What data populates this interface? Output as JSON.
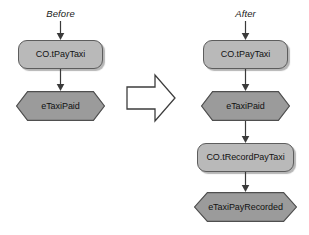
{
  "diagram": {
    "type": "before-after-process-flow",
    "title": "",
    "columns": [
      {
        "id": "before",
        "label": "Before",
        "nodes": [
          {
            "id": "before-task-paytaxi",
            "kind": "task",
            "shape": "rounded-rectangle",
            "label": "CO.tPayTaxi",
            "fill": "#b9b9b9"
          },
          {
            "id": "before-event-taxipaid",
            "kind": "event",
            "shape": "hexagon",
            "label": "eTaxiPaid",
            "fill": "#9b9b9b"
          }
        ]
      },
      {
        "id": "after",
        "label": "After",
        "nodes": [
          {
            "id": "after-task-paytaxi",
            "kind": "task",
            "shape": "rounded-rectangle",
            "label": "CO.tPayTaxi",
            "fill": "#b9b9b9"
          },
          {
            "id": "after-event-taxipaid",
            "kind": "event",
            "shape": "hexagon",
            "label": "eTaxiPaid",
            "fill": "#9b9b9b"
          },
          {
            "id": "after-task-recordpaytaxi",
            "kind": "task",
            "shape": "rounded-rectangle",
            "label": "CO.tRecordPayTaxi",
            "fill": "#b9b9b9"
          },
          {
            "id": "after-event-taxipayrecorded",
            "kind": "event",
            "shape": "hexagon",
            "label": "eTaxiPayRecorded",
            "fill": "#9b9b9b"
          }
        ]
      }
    ],
    "transition": {
      "icon": "right-block-arrow",
      "label": "",
      "fill": "#ffffff",
      "stroke": "#3d3d3d"
    },
    "colors": {
      "task_fill": "#b9b9b9",
      "event_fill": "#9b9b9b",
      "stroke": "#5d5d5d",
      "text": "#121212",
      "background": "#ffffff",
      "shadow": "#5a5a5a"
    }
  }
}
